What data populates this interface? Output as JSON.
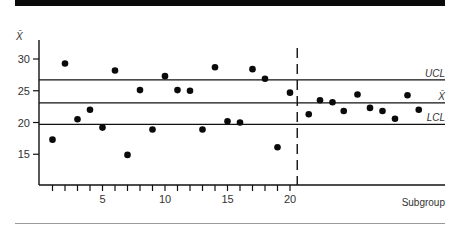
{
  "chart_data": {
    "type": "scatter",
    "title": "",
    "ylabel": "X̄",
    "xlabel": "Subgroup",
    "ylim": [
      10.5,
      34
    ],
    "xlim": [
      0,
      32
    ],
    "yticks": [
      15,
      20,
      25,
      30
    ],
    "xticks_labeled": [
      5,
      10,
      15,
      20
    ],
    "xtick_count": 20,
    "grid": false,
    "control_lines": [
      {
        "name": "UCL",
        "label": "UCL",
        "value": 26.7
      },
      {
        "name": "center",
        "label": "X̄",
        "value": 23.1
      },
      {
        "name": "LCL",
        "label": "LCL",
        "value": 19.7
      }
    ],
    "phase_divider_x": 20.5,
    "series": [
      {
        "name": "subgroup-means",
        "x": [
          1,
          2,
          3,
          4,
          5,
          6,
          7,
          8,
          9,
          10,
          11,
          12,
          13,
          14,
          15,
          16,
          17,
          18,
          19,
          20,
          21.5,
          22.4,
          23.4,
          24.3,
          25.4,
          26.4,
          27.4,
          28.4,
          29.4,
          30.3
        ],
        "y": [
          17.3,
          29.3,
          20.5,
          22.0,
          19.2,
          28.2,
          14.9,
          25.1,
          18.9,
          27.3,
          25.1,
          25.0,
          18.9,
          28.7,
          20.2,
          20.0,
          28.4,
          26.9,
          16.1,
          24.7,
          21.3,
          23.5,
          23.2,
          21.8,
          24.4,
          22.3,
          21.8,
          20.6,
          24.3,
          22.0
        ]
      }
    ]
  }
}
